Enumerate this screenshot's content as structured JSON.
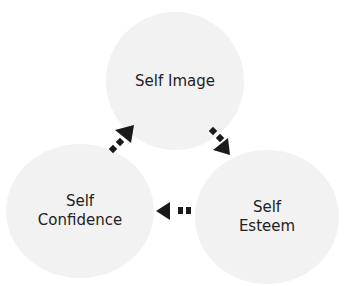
{
  "nodes": {
    "top": {
      "line1": "Self Image"
    },
    "left": {
      "line1": "Self",
      "line2": "Confidence"
    },
    "right": {
      "line1": "Self",
      "line2": "Esteem"
    }
  },
  "edges": [
    {
      "from": "Self Image",
      "to": "Self Esteem"
    },
    {
      "from": "Self Esteem",
      "to": "Self Confidence"
    },
    {
      "from": "Self Confidence",
      "to": "Self Image"
    }
  ],
  "colors": {
    "circle": "#f2f2f2",
    "arrow": "#1a1a1a",
    "text": "#222222"
  }
}
